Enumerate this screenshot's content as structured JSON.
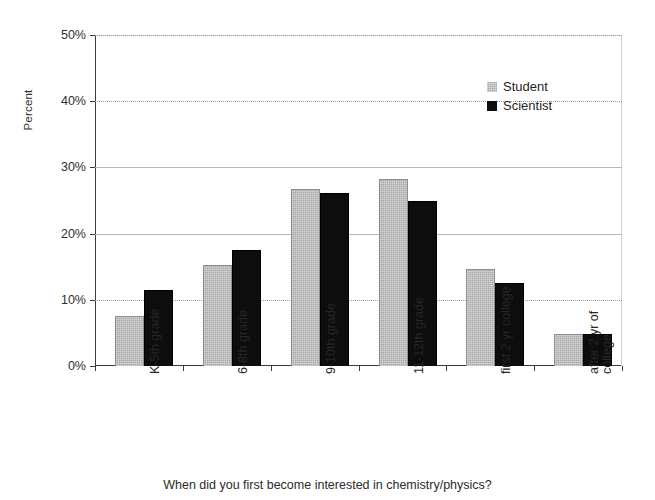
{
  "chart_data": {
    "type": "bar",
    "title": "",
    "xlabel": "When did you first become interested in chemistry/physics?",
    "ylabel": "Percent",
    "ylim": [
      0,
      50
    ],
    "ytick_labels": [
      "0%",
      "10%",
      "20%",
      "30%",
      "40%",
      "50%"
    ],
    "ytick_values": [
      0,
      10,
      20,
      30,
      40,
      50
    ],
    "grid": true,
    "legend_position": "upper right",
    "categories": [
      "K-5th grade",
      "6-8th grade",
      "9-10th grade",
      "11-12th grade",
      "first 2 yr college",
      "after 2 yr of\ncollege"
    ],
    "series": [
      {
        "name": "Student",
        "color": "#a9a9a9",
        "values": [
          7.5,
          15.3,
          26.8,
          28.3,
          14.6,
          4.9
        ]
      },
      {
        "name": "Scientist",
        "color": "#0d0d0d",
        "values": [
          11.5,
          17.5,
          26.2,
          25.0,
          12.5,
          4.8
        ]
      }
    ]
  },
  "legend": {
    "items": [
      {
        "label": "Student"
      },
      {
        "label": "Scientist"
      }
    ]
  },
  "axes": {
    "y_title": "Percent",
    "x_title": "When did you first become interested in chemistry/physics?"
  }
}
